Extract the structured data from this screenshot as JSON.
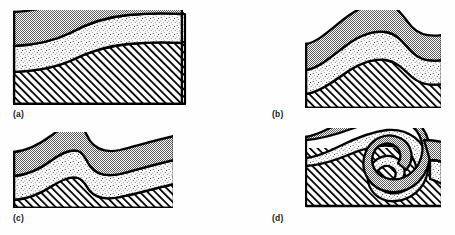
{
  "figure": {
    "background_color": "#fefefe",
    "outline_color": "#000000",
    "panel_count": 4
  },
  "legend_units": [
    {
      "key": "upper",
      "name": "upper-gray-bed",
      "fill_pattern": "gray-checker",
      "color": "#8c8c8c",
      "position": "top"
    },
    {
      "key": "middle",
      "name": "middle-stipple-bed",
      "fill_pattern": "fine-stipple",
      "color": "#e8e8e8",
      "position": "middle"
    },
    {
      "key": "lower",
      "name": "lower-hatched-bed",
      "fill_pattern": "diagonal-hatch",
      "color": "#ffffff",
      "position": "bottom"
    }
  ],
  "panels": [
    {
      "id": "a",
      "label": "(a)",
      "stage": "monocline",
      "box": {
        "x": 13,
        "y": 10,
        "width": 170,
        "height": 95
      },
      "label_pos": {
        "x": 13,
        "y": 110
      }
    },
    {
      "id": "b",
      "label": "(b)",
      "stage": "open-fold",
      "box": {
        "x": 305,
        "y": 10,
        "width": 136,
        "height": 98
      },
      "label_pos": {
        "x": 272,
        "y": 110
      }
    },
    {
      "id": "c",
      "label": "(c)",
      "stage": "tightened-fold",
      "box": {
        "x": 13,
        "y": 132,
        "width": 160,
        "height": 76
      },
      "label_pos": {
        "x": 13,
        "y": 214
      }
    },
    {
      "id": "d",
      "label": "(d)",
      "stage": "recumbent-overturned-fold",
      "box": {
        "x": 305,
        "y": 128,
        "width": 136,
        "height": 80
      },
      "label_pos": {
        "x": 272,
        "y": 214
      }
    }
  ]
}
